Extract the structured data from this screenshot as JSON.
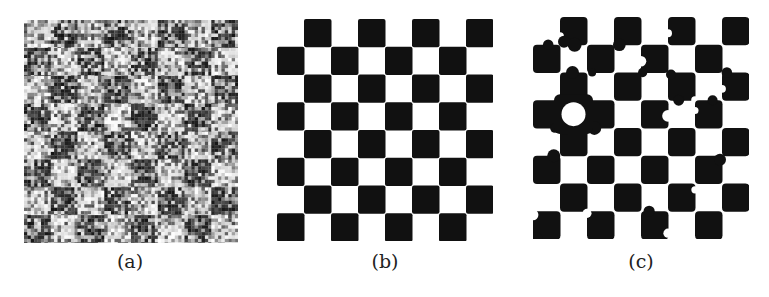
{
  "figure": {
    "panels": [
      {
        "id": "a",
        "caption": "(a)",
        "description": "noisy checkerboard input",
        "grid": 8,
        "top_left": "light"
      },
      {
        "id": "b",
        "caption": "(b)",
        "description": "clean binary checkerboard segmentation",
        "grid": 8,
        "top_left": "white"
      },
      {
        "id": "c",
        "caption": "(c)",
        "description": "binary checkerboard segmentation with blob artifacts",
        "grid": 8,
        "top_left": "white"
      }
    ],
    "colors": {
      "dark": "#111111",
      "light": "#ffffff",
      "noise_dark": "#3a3a3a",
      "noise_light": "#d8d8d8"
    }
  }
}
